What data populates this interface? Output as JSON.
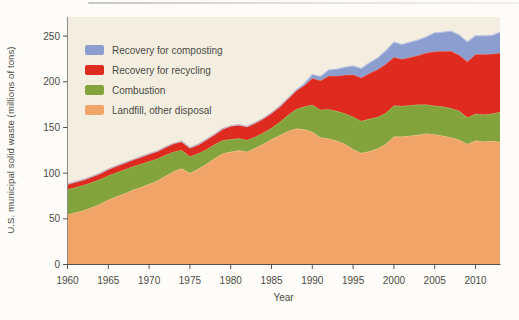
{
  "figure": {
    "page_background": "#fdfcf8",
    "panel_color": "#f4eee0",
    "axis_color": "#55534a",
    "spine_color": "#8f8d83",
    "text_color": "#4b4a45"
  },
  "chart_data": {
    "type": "area",
    "stacked": true,
    "title": "",
    "xlabel": "Year",
    "ylabel": "U.S. municipal solid waste (millions of tons)",
    "xlim": [
      1960,
      2013
    ],
    "ylim": [
      0,
      271
    ],
    "grid": false,
    "legend_position": "top-left-inside",
    "legend_order_top_to_bottom": [
      "Recovery for composting",
      "Recovery for recycling",
      "Combustion",
      "Landfill, other disposal"
    ],
    "x_tick_values": [
      1960,
      1965,
      1970,
      1975,
      1980,
      1985,
      1990,
      1995,
      2000,
      2005,
      2010
    ],
    "y_tick_values": [
      0,
      50,
      100,
      150,
      200,
      250
    ],
    "x": [
      1960,
      1961,
      1962,
      1963,
      1964,
      1965,
      1966,
      1967,
      1968,
      1969,
      1970,
      1971,
      1972,
      1973,
      1974,
      1975,
      1976,
      1977,
      1978,
      1979,
      1980,
      1981,
      1982,
      1983,
      1984,
      1985,
      1986,
      1987,
      1988,
      1989,
      1990,
      1991,
      1992,
      1993,
      1994,
      1995,
      1996,
      1997,
      1998,
      1999,
      2000,
      2001,
      2002,
      2003,
      2004,
      2005,
      2006,
      2007,
      2008,
      2009,
      2010,
      2011,
      2012,
      2013
    ],
    "series": [
      {
        "name": "Landfill, other disposal",
        "color": "#f1a468",
        "edge": "#f8c795",
        "values": [
          54.7,
          57.0,
          59.5,
          62.7,
          66.2,
          70.8,
          74.3,
          77.9,
          81.5,
          84.6,
          88.0,
          91.8,
          97.0,
          102.0,
          105.0,
          100.2,
          104.5,
          110.0,
          116.0,
          121.5,
          123.4,
          125.0,
          123.5,
          127.5,
          132.0,
          137.1,
          141.5,
          146.0,
          149.0,
          148.0,
          145.3,
          139.0,
          138.0,
          135.5,
          132.0,
          126.3,
          122.0,
          124.0,
          127.0,
          132.0,
          140.3,
          140.0,
          141.0,
          142.0,
          143.5,
          142.3,
          141.0,
          139.0,
          136.7,
          131.9,
          135.7,
          134.8,
          135.2,
          134.3
        ]
      },
      {
        "name": "Combustion",
        "color": "#83a33c",
        "edge": "#abc06a",
        "values": [
          27.7,
          27.6,
          27.5,
          27.4,
          27.1,
          26.8,
          26.5,
          26.2,
          25.8,
          25.5,
          25.1,
          24.0,
          23.0,
          21.5,
          20.5,
          18.2,
          17.0,
          16.0,
          15.3,
          14.5,
          13.7,
          13.2,
          12.8,
          12.4,
          12.2,
          12.5,
          14.5,
          17.5,
          21.0,
          25.0,
          29.7,
          30.5,
          32.0,
          32.5,
          33.5,
          35.5,
          35.0,
          35.5,
          34.5,
          34.0,
          33.7,
          33.4,
          33.4,
          33.1,
          31.8,
          31.6,
          31.9,
          32.0,
          31.6,
          29.0,
          29.3,
          29.3,
          29.8,
          32.7
        ]
      },
      {
        "name": "Recovery for recycling",
        "color": "#de2a1f",
        "edge": "#ea6852",
        "values": [
          5.6,
          5.8,
          5.9,
          6.1,
          6.4,
          6.8,
          7.0,
          7.2,
          7.5,
          7.7,
          8.0,
          8.3,
          8.6,
          9.0,
          9.2,
          9.3,
          9.8,
          10.5,
          11.2,
          12.5,
          14.5,
          14.8,
          14.7,
          15.1,
          15.6,
          16.4,
          17.0,
          18.0,
          20.0,
          23.0,
          29.0,
          32.0,
          36.5,
          38.5,
          42.0,
          46.1,
          47.5,
          50.0,
          52.0,
          53.5,
          53.0,
          51.5,
          52.5,
          54.0,
          56.5,
          59.2,
          60.7,
          62.7,
          61.0,
          61.3,
          65.3,
          66.2,
          65.6,
          64.7
        ]
      },
      {
        "name": "Recovery for composting",
        "color": "#8c9dcf",
        "edge": "#b7c2e3",
        "values": [
          0,
          0,
          0,
          0,
          0,
          0,
          0,
          0,
          0,
          0,
          0,
          0,
          0,
          0,
          0,
          0,
          0,
          0,
          0,
          0,
          0,
          0,
          0,
          0,
          0,
          0,
          0,
          0,
          1.0,
          2.0,
          4.2,
          4.5,
          6.5,
          7.5,
          8.5,
          9.6,
          10.0,
          11.5,
          12.5,
          14.5,
          16.5,
          16.0,
          16.5,
          16.8,
          17.5,
          20.6,
          20.8,
          21.7,
          22.1,
          21.4,
          20.2,
          20.1,
          20.2,
          22.4
        ]
      }
    ]
  }
}
